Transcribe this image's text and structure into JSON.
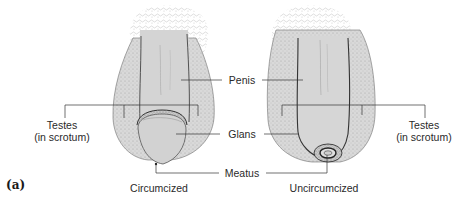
{
  "figure": {
    "panel_label": "(a)",
    "left_caption": "Circumcized",
    "right_caption": "Uncircumcized",
    "labels": {
      "penis": "Penis",
      "glans": "Glans",
      "meatus": "Meatus",
      "testes_left_line1": "Testes",
      "testes_left_line2": "(in scrotum)",
      "testes_right_line1": "Testes",
      "testes_right_line2": "(in scrotum)"
    },
    "colors": {
      "skin_fill": "#d6d6d6",
      "shading": "#9a9a9a",
      "outline": "#3a3a3a",
      "leader_line": "#333333",
      "text": "#2a2a2a"
    }
  }
}
